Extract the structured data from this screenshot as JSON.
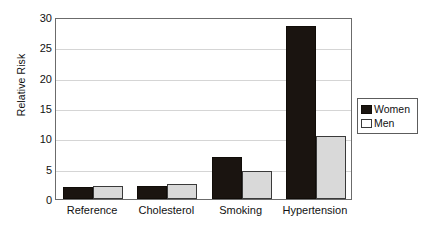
{
  "chart_data": {
    "type": "bar",
    "title": "",
    "xlabel": "",
    "ylabel": "Relative Risk",
    "categories": [
      "Reference",
      "Cholesterol",
      "Smoking",
      "Hypertension"
    ],
    "series": [
      {
        "name": "Women",
        "color": "#1a1410",
        "values": [
          2.0,
          2.2,
          7.0,
          28.5
        ]
      },
      {
        "name": "Men",
        "color": "#d9d9d9",
        "values": [
          2.2,
          2.4,
          4.7,
          10.4
        ]
      }
    ],
    "ylim": [
      0,
      30
    ],
    "ytick_labels": [
      "0",
      "5",
      "10",
      "15",
      "20",
      "25",
      "30"
    ],
    "ytick_values": [
      0,
      5,
      10,
      15,
      20,
      25,
      30
    ],
    "grid": true,
    "legend_position": "right",
    "legend_entries": [
      "Women",
      "Men"
    ]
  }
}
